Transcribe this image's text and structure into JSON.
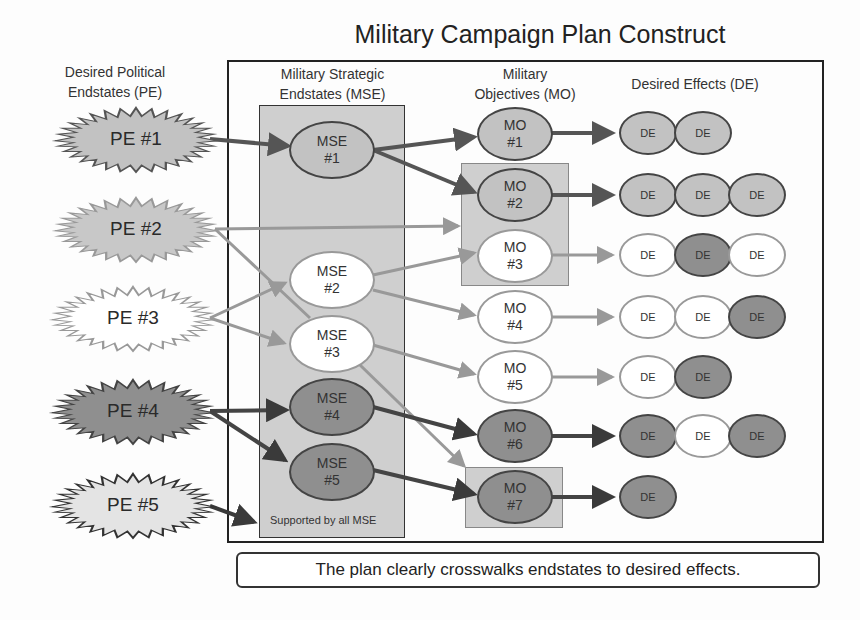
{
  "title": "Military Campaign Plan Construct",
  "headers": {
    "pe": [
      "Desired Political",
      "Endstates (PE)"
    ],
    "mse": [
      "Military Strategic",
      "Endstates (MSE)"
    ],
    "mo": [
      "Military",
      "Objectives (MO)"
    ],
    "de": "Desired Effects (DE)"
  },
  "pe": [
    {
      "label": "PE #1",
      "shade": "med"
    },
    {
      "label": "PE #2",
      "shade": "med"
    },
    {
      "label": "PE #3",
      "shade": "light"
    },
    {
      "label": "PE #4",
      "shade": "dark"
    },
    {
      "label": "PE #5",
      "shade": "light-gray"
    }
  ],
  "mse": [
    {
      "line1": "MSE",
      "line2": "#1",
      "shade": "med"
    },
    {
      "line1": "MSE",
      "line2": "#2",
      "shade": "light"
    },
    {
      "line1": "MSE",
      "line2": "#3",
      "shade": "light"
    },
    {
      "line1": "MSE",
      "line2": "#4",
      "shade": "dark"
    },
    {
      "line1": "MSE",
      "line2": "#5",
      "shade": "dark"
    }
  ],
  "mse_note": "Supported by all MSE",
  "mo": [
    {
      "line1": "MO",
      "line2": "#1",
      "shade": "med",
      "de": [
        "med",
        "med"
      ]
    },
    {
      "line1": "MO",
      "line2": "#2",
      "shade": "med",
      "de": [
        "med",
        "med",
        "med"
      ]
    },
    {
      "line1": "MO",
      "line2": "#3",
      "shade": "light",
      "de": [
        "light",
        "dark",
        "light"
      ]
    },
    {
      "line1": "MO",
      "line2": "#4",
      "shade": "light",
      "de": [
        "light",
        "light",
        "dark"
      ]
    },
    {
      "line1": "MO",
      "line2": "#5",
      "shade": "light",
      "de": [
        "light",
        "dark"
      ]
    },
    {
      "line1": "MO",
      "line2": "#6",
      "shade": "dark",
      "de": [
        "dark",
        "light",
        "dark"
      ]
    },
    {
      "line1": "MO",
      "line2": "#7",
      "shade": "dark",
      "de": [
        "dark"
      ]
    }
  ],
  "de_label": "DE",
  "caption": "The plan clearly crosswalks endstates to desired effects.",
  "colors": {
    "dark": "#8f8f8f",
    "med": "#c2c2c2",
    "light": "#ffffff",
    "box": "#cfcfcf"
  }
}
